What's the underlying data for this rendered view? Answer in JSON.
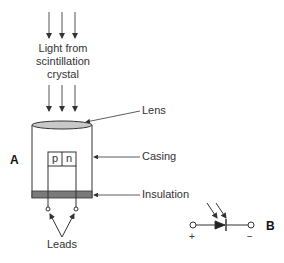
{
  "diagram": {
    "top_label": [
      "Light from",
      "scintillation",
      "crystal"
    ],
    "labels": {
      "lens": "Lens",
      "casing": "Casing",
      "insulation": "Insulation",
      "leads": "Leads",
      "p": "p",
      "n": "n",
      "panel_a": "A",
      "panel_b": "B",
      "plus": "+",
      "minus": "−"
    },
    "colors": {
      "line": "#333333",
      "lens_fill": "#c8c8c8",
      "insulation_fill": "#7a7a7a"
    }
  }
}
